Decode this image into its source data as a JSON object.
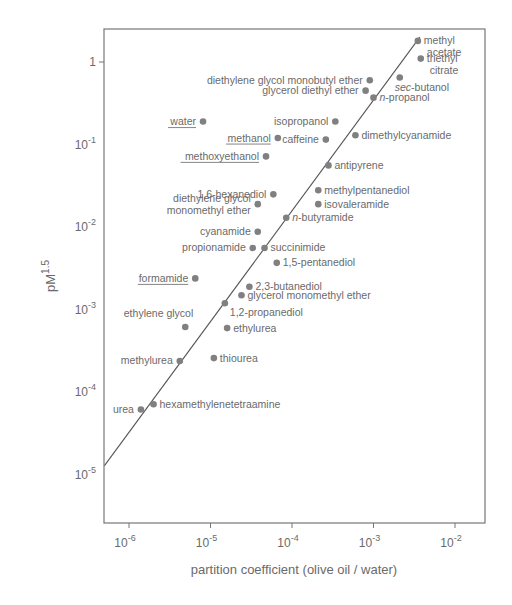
{
  "chart_data": {
    "type": "scatter",
    "title": "",
    "xlabel": "partition coefficient (olive oil / water)",
    "ylabel": "pM^1.5",
    "ylabel_base": "pM",
    "ylabel_sup": "1.5",
    "xscale": "log",
    "yscale": "log",
    "xlim": [
      5e-07,
      0.025
    ],
    "ylim": [
      1.3e-05,
      2.5
    ],
    "grid": false,
    "legend": null,
    "x_ticks": [
      {
        "value": 1e-06,
        "base": "10",
        "exp": "-6"
      },
      {
        "value": 1e-05,
        "base": "10",
        "exp": "-5"
      },
      {
        "value": 0.0001,
        "base": "10",
        "exp": "-4"
      },
      {
        "value": 0.001,
        "base": "10",
        "exp": "-3"
      },
      {
        "value": 0.01,
        "base": "10",
        "exp": "-2"
      }
    ],
    "y_ticks": [
      {
        "value": 1,
        "base": "1",
        "exp": ""
      },
      {
        "value": 0.1,
        "base": "10",
        "exp": "-1"
      },
      {
        "value": 0.01,
        "base": "10",
        "exp": "-2"
      },
      {
        "value": 0.001,
        "base": "10",
        "exp": "-3"
      },
      {
        "value": 0.0001,
        "base": "10",
        "exp": "-4"
      },
      {
        "value": 1e-05,
        "base": "10",
        "exp": "-5"
      }
    ],
    "fit_line": {
      "x": [
        5e-07,
        0.0037
      ],
      "y": [
        1.3e-05,
        2.0
      ]
    },
    "points": [
      {
        "name": "methyl acetate",
        "lines": [
          "methyl",
          "acetate"
        ],
        "x": 0.0035,
        "y": 1.8,
        "underline": false,
        "label_side": "right"
      },
      {
        "name": "triethyl citrate",
        "lines": [
          "triethyl",
          "citrate"
        ],
        "x": 0.0038,
        "y": 1.1,
        "underline": false,
        "label_side": "right"
      },
      {
        "name": "sec-butanol",
        "lines": [
          "sec-butanol"
        ],
        "x": 0.0021,
        "y": 0.65,
        "underline": false,
        "label_side": "below"
      },
      {
        "name": "diethylene glycol monobutyl ether",
        "lines": [
          "diethylene glycol monobutyl ether"
        ],
        "x": 0.0009,
        "y": 0.6,
        "underline": false,
        "label_side": "left"
      },
      {
        "name": "glycerol diethyl ether",
        "lines": [
          "glycerol diethyl ether"
        ],
        "x": 0.0008,
        "y": 0.45,
        "underline": false,
        "label_side": "left"
      },
      {
        "name": "n-propanol",
        "lines": [
          "n-propanol"
        ],
        "x": 0.001,
        "y": 0.37,
        "underline": false,
        "label_side": "right"
      },
      {
        "name": "isopropanol",
        "lines": [
          "isopropanol"
        ],
        "x": 0.00034,
        "y": 0.19,
        "underline": false,
        "label_side": "left"
      },
      {
        "name": "caffeine",
        "lines": [
          "caffeine"
        ],
        "x": 0.00026,
        "y": 0.115,
        "underline": false,
        "label_side": "left"
      },
      {
        "name": "dimethylcyanamide",
        "lines": [
          "dimethylcyanamide"
        ],
        "x": 0.0006,
        "y": 0.13,
        "underline": false,
        "label_side": "right"
      },
      {
        "name": "water",
        "lines": [
          "water"
        ],
        "x": 8.1e-06,
        "y": 0.19,
        "underline": true,
        "label_side": "left"
      },
      {
        "name": "methanol",
        "lines": [
          "methanol"
        ],
        "x": 6.7e-05,
        "y": 0.12,
        "underline": true,
        "label_side": "left"
      },
      {
        "name": "methoxyethanol",
        "lines": [
          "methoxyethanol"
        ],
        "x": 4.8e-05,
        "y": 0.072,
        "underline": true,
        "label_side": "left"
      },
      {
        "name": "antipyrene",
        "lines": [
          "antipyrene"
        ],
        "x": 0.00028,
        "y": 0.056,
        "underline": false,
        "label_side": "right"
      },
      {
        "name": "1,6-hexanediol",
        "lines": [
          "1,6-hexanediol"
        ],
        "x": 5.9e-05,
        "y": 0.025,
        "underline": false,
        "label_side": "left"
      },
      {
        "name": "diethylene glycol monomethyl ether",
        "lines": [
          "diethylene glycol",
          "monomethyl ether"
        ],
        "x": 3.8e-05,
        "y": 0.019,
        "underline": false,
        "label_side": "left"
      },
      {
        "name": "methylpentanediol",
        "lines": [
          "methylpentanediol"
        ],
        "x": 0.00021,
        "y": 0.028,
        "underline": false,
        "label_side": "right"
      },
      {
        "name": "isovaleramide",
        "lines": [
          "isovaleramide"
        ],
        "x": 0.00021,
        "y": 0.019,
        "underline": false,
        "label_side": "right"
      },
      {
        "name": "n-butyramide",
        "lines": [
          "n-butyramide"
        ],
        "x": 8.5e-05,
        "y": 0.013,
        "underline": false,
        "label_side": "right"
      },
      {
        "name": "cyanamide",
        "lines": [
          "cyanamide"
        ],
        "x": 3.8e-05,
        "y": 0.0088,
        "underline": false,
        "label_side": "left"
      },
      {
        "name": "propionamide",
        "lines": [
          "propionamide"
        ],
        "x": 3.3e-05,
        "y": 0.0056,
        "underline": false,
        "label_side": "left"
      },
      {
        "name": "succinimide",
        "lines": [
          "succinimide"
        ],
        "x": 4.6e-05,
        "y": 0.0056,
        "underline": false,
        "label_side": "right"
      },
      {
        "name": "1,5-pentanediol",
        "lines": [
          "1,5-pentanediol"
        ],
        "x": 6.5e-05,
        "y": 0.0037,
        "underline": false,
        "label_side": "right"
      },
      {
        "name": "formamide",
        "lines": [
          "formamide"
        ],
        "x": 6.5e-06,
        "y": 0.0024,
        "underline": true,
        "label_side": "left"
      },
      {
        "name": "2,3-butanediol",
        "lines": [
          "2,3-butanediol"
        ],
        "x": 3e-05,
        "y": 0.0019,
        "underline": false,
        "label_side": "right"
      },
      {
        "name": "glycerol monomethyl ether",
        "lines": [
          "glycerol monomethyl ether"
        ],
        "x": 2.4e-05,
        "y": 0.0015,
        "underline": false,
        "label_side": "right"
      },
      {
        "name": "1,2-propanediol",
        "lines": [
          "1,2-propanediol"
        ],
        "x": 1.5e-05,
        "y": 0.0012,
        "underline": false,
        "label_side": "below-right"
      },
      {
        "name": "ethylene glycol",
        "lines": [
          "ethylene glycol"
        ],
        "x": 4.9e-06,
        "y": 0.00062,
        "underline": false,
        "label_side": "above-left"
      },
      {
        "name": "ethylurea",
        "lines": [
          "ethylurea"
        ],
        "x": 1.6e-05,
        "y": 0.0006,
        "underline": false,
        "label_side": "right"
      },
      {
        "name": "methylurea",
        "lines": [
          "methylurea"
        ],
        "x": 4.2e-06,
        "y": 0.00024,
        "underline": false,
        "label_side": "left"
      },
      {
        "name": "thiourea",
        "lines": [
          "thiourea"
        ],
        "x": 1.1e-05,
        "y": 0.00026,
        "underline": false,
        "label_side": "right"
      },
      {
        "name": "urea",
        "lines": [
          "urea"
        ],
        "x": 1.4e-06,
        "y": 6.2e-05,
        "underline": false,
        "label_side": "left"
      },
      {
        "name": "hexamethylenetetraamine",
        "lines": [
          "hexamethylenetetraamine"
        ],
        "x": 2e-06,
        "y": 7.2e-05,
        "underline": false,
        "label_side": "right"
      }
    ]
  },
  "colors": {
    "background": "#ffffff",
    "axis": "#777777",
    "point": "#808080",
    "text": "#6a6a6a",
    "line": "#555555"
  }
}
